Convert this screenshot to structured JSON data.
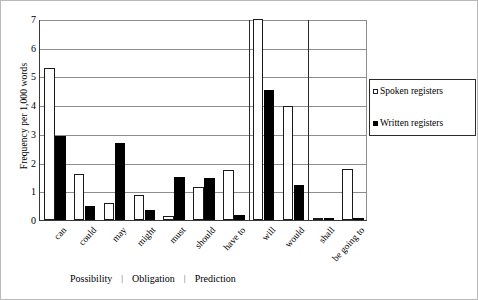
{
  "chart_data": {
    "type": "bar",
    "title": "",
    "xlabel": "",
    "ylabel": "Frequency per 1,000 words",
    "ylim": [
      0,
      7
    ],
    "yticks": [
      "0",
      "1",
      "2",
      "3",
      "4",
      "5",
      "6",
      "7"
    ],
    "grid": true,
    "legend_position": "right",
    "categories": [
      "can",
      "could",
      "may",
      "might",
      "must",
      "should",
      "have to",
      "will",
      "would",
      "shall",
      "be going to"
    ],
    "series": [
      {
        "name": "Spoken registers",
        "values": [
          5.3,
          1.59,
          0.58,
          0.88,
          0.15,
          1.15,
          1.73,
          7.0,
          3.96,
          0.02,
          1.77
        ]
      },
      {
        "name": "Written registers",
        "values": [
          2.94,
          0.49,
          2.68,
          0.36,
          1.51,
          1.45,
          0.18,
          4.53,
          1.23,
          0.08,
          0.01
        ]
      }
    ],
    "group_separators_after": [
      "have to",
      "would"
    ],
    "function_groups": [
      "Possibility",
      "Obligation",
      "Prediction"
    ],
    "separator_glyph": "|",
    "colors": {
      "spoken_fill": "#ffffff",
      "spoken_edge": "#1a1a1a",
      "written_fill": "#000000",
      "grid": "#8d8d8d",
      "axis": "#3a3a3a",
      "background": "#ffffff"
    }
  },
  "legend": {
    "items": [
      {
        "label": "Spoken registers",
        "marker": "open-square"
      },
      {
        "label": "Written registers",
        "marker": "filled-square"
      }
    ]
  }
}
